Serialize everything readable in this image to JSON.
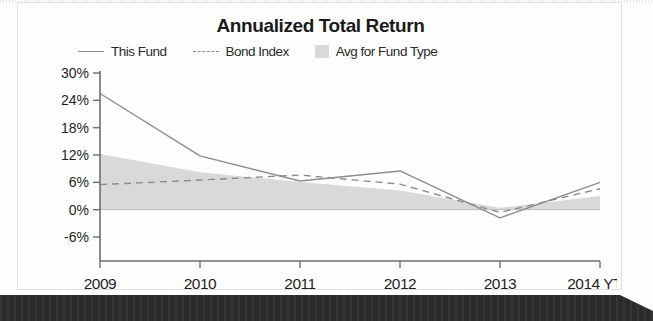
{
  "chart_data": {
    "type": "line",
    "title": "Annualized Total Return",
    "xlabel": "",
    "ylabel": "",
    "x": [
      "2009",
      "2010",
      "2011",
      "2012",
      "2013",
      "2014 YTC"
    ],
    "categories": [
      "2009",
      "2010",
      "2011",
      "2012",
      "2013",
      "2014 YTC"
    ],
    "ylim": [
      -6,
      30
    ],
    "yticks": [
      30,
      24,
      18,
      12,
      6,
      0,
      -6
    ],
    "ytick_labels": [
      "30%",
      "24%",
      "18%",
      "12%",
      "6%",
      "0%",
      "-6%"
    ],
    "xtick_labels": [
      "2009",
      "2010",
      "2011",
      "2012",
      "2013",
      "2014 YTC"
    ],
    "grid": false,
    "legend_position": "top",
    "series": [
      {
        "name": "This Fund",
        "style": "solid",
        "color": "#8d8d8d",
        "values": [
          25.5,
          11.8,
          6.3,
          8.5,
          -1.8,
          6.0
        ]
      },
      {
        "name": "Bond Index",
        "style": "dashed",
        "color": "#8d8d8d",
        "values": [
          5.5,
          6.5,
          7.6,
          5.6,
          -0.6,
          4.6
        ]
      },
      {
        "name": "Avg for Fund Type",
        "style": "band",
        "color": "#d9d9d9",
        "values": [
          12.2,
          8.2,
          6.1,
          4.2,
          0.4,
          3.0
        ],
        "baseline": 0
      }
    ]
  },
  "chart": {
    "title": "Annualized Total Return",
    "legend": [
      {
        "label": "This Fund",
        "marker": "solid-line-swatch"
      },
      {
        "label": "Bond Index",
        "marker": "dashed-line-swatch"
      },
      {
        "label": "Avg for Fund Type",
        "marker": "filled-box-swatch"
      }
    ],
    "y_axis": {
      "labels": [
        "30%",
        "24%",
        "18%",
        "12%",
        "6%",
        "0%",
        "-6%"
      ]
    },
    "x_axis": {
      "labels": [
        "2009",
        "2010",
        "2011",
        "2012",
        "2013",
        "2014 YTC"
      ]
    }
  },
  "colors": {
    "line": "#8d8d8d",
    "band": "#d9d9d9",
    "axis": "#6e6e6e",
    "text": "#1f1f1f",
    "banner": "#2b2b2b"
  }
}
